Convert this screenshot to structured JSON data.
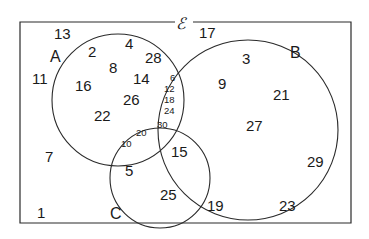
{
  "diagram": {
    "type": "venn",
    "universal_set_symbol": "ℰ",
    "sets": [
      {
        "name": "A",
        "label": "A"
      },
      {
        "name": "B",
        "label": "B"
      },
      {
        "name": "C",
        "label": "C"
      }
    ],
    "regions": {
      "outside_all": [
        "13",
        "11",
        "7",
        "1",
        "17",
        "29",
        "19",
        "23"
      ],
      "A_only": [
        "2",
        "4",
        "8",
        "28",
        "16",
        "14",
        "26",
        "22"
      ],
      "A_and_B_only": [
        "6",
        "12",
        "18",
        "24"
      ],
      "A_and_C_only": [
        "20",
        "10"
      ],
      "A_and_B_and_C": [
        "30"
      ],
      "B_only": [
        "3",
        "9",
        "21",
        "27"
      ],
      "B_and_C_only": [
        "15"
      ],
      "C_only": [
        "5",
        "25"
      ]
    },
    "labels": {
      "universal": "ℰ",
      "A": "A",
      "B": "B",
      "C": "C"
    },
    "numbers": {
      "n13": "13",
      "n11": "11",
      "n7": "7",
      "n1": "1",
      "n17": "17",
      "n29": "29",
      "n19": "19",
      "n23": "23",
      "n2": "2",
      "n4": "4",
      "n8": "8",
      "n28": "28",
      "n16": "16",
      "n14": "14",
      "n26": "26",
      "n22": "22",
      "n6": "6",
      "n12": "12",
      "n18": "18",
      "n24": "24",
      "n20": "20",
      "n10": "10",
      "n30": "30",
      "n3": "3",
      "n9": "9",
      "n21": "21",
      "n27": "27",
      "n15": "15",
      "n5": "5",
      "n25": "25"
    }
  }
}
